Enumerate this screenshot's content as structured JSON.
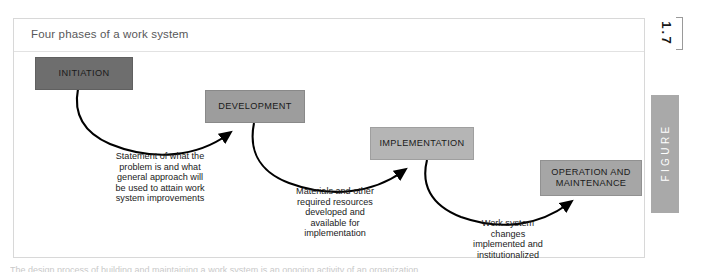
{
  "figure": {
    "caption": "Four phases of a work system",
    "number": "1.7",
    "tab_label": "FIGURE"
  },
  "diagram": {
    "type": "flow",
    "phases": [
      {
        "id": "initiation",
        "label": "INITIATION",
        "fill": "#6e6e6e"
      },
      {
        "id": "development",
        "label": "DEVELOPMENT",
        "fill": "#9d9d9d"
      },
      {
        "id": "implementation",
        "label": "IMPLEMENTATION",
        "fill": "#b5b5b5"
      },
      {
        "id": "operation",
        "label": "OPERATION AND\nMAINTENANCE",
        "fill": "#a6a6a6"
      }
    ],
    "connectors": [
      {
        "id": "initiation-to-development",
        "from": "initiation",
        "to": "development",
        "label": "Statement of what the\nproblem is and what\ngeneral approach will\nbe used to attain work\nsystem improvements"
      },
      {
        "id": "development-to-implementation",
        "from": "development",
        "to": "implementation",
        "label": "Materials and other\nrequired resources\ndeveloped and\navailable for\nimplementation"
      },
      {
        "id": "implementation-to-operation",
        "from": "implementation",
        "to": "operation",
        "label": "Work system\nchanges\nimplemented and\ninstitutionalized"
      }
    ]
  },
  "page": {
    "bottom_text_fragment": "The design process of building and maintaining a work system is an ongoing activity of an organization."
  }
}
